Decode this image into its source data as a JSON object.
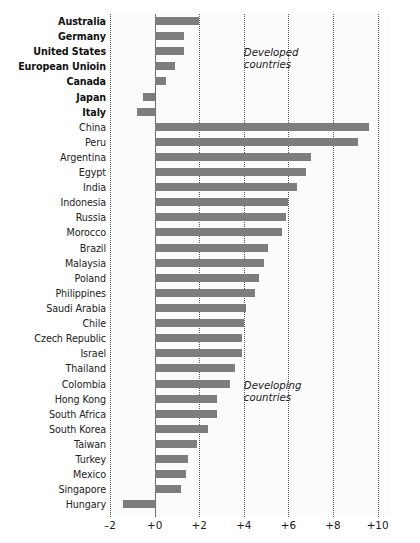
{
  "chart_data": {
    "type": "bar",
    "orientation": "horizontal",
    "title": "",
    "subtitle": "",
    "xlabel": "",
    "ylabel": "",
    "xlim": [
      -2,
      10.6
    ],
    "grid": true,
    "gridlines": [
      -2,
      0,
      2,
      4,
      6,
      8,
      10
    ],
    "tick_labels": [
      "–2",
      "+0",
      "+2",
      "+4",
      "+6",
      "+8",
      "+10"
    ],
    "tick_values": [
      -2,
      0,
      2,
      4,
      6,
      8,
      10
    ],
    "bar_color": "#7d7d7d",
    "legend": null,
    "annotations": [
      {
        "text": "Developed\ncountries",
        "x": 4.0,
        "y_row": 2
      },
      {
        "text": "Developing\ncountries",
        "x": 4.0,
        "y_row": 24
      }
    ],
    "groups": [
      {
        "name": "Developed countries",
        "style": "bold",
        "categories": [
          "Australia",
          "Germany",
          "United States",
          "European Unioin",
          "Canada",
          "Japan",
          "Italy"
        ],
        "values": [
          2.0,
          1.3,
          1.3,
          0.9,
          0.5,
          -0.5,
          -0.8
        ]
      },
      {
        "name": "Developing countries",
        "style": "regular",
        "categories": [
          "China",
          "Peru",
          "Argentina",
          "Egypt",
          "India",
          "Indonesia",
          "Russia",
          "Morocco",
          "Brazil",
          "Malaysia",
          "Poland",
          "Philippines",
          "Saudi Arabia",
          "Chile",
          "Czech Republic",
          "Israel",
          "Thailand",
          "Colombia",
          "Hong Kong",
          "South Africa",
          "South Korea",
          "Taiwan",
          "Turkey",
          "Mexico",
          "Singapore",
          "Hungary"
        ],
        "values": [
          9.6,
          9.1,
          7.0,
          6.8,
          6.4,
          6.0,
          5.9,
          5.7,
          5.1,
          4.9,
          4.7,
          4.5,
          4.1,
          4.0,
          3.9,
          3.9,
          3.6,
          3.4,
          2.8,
          2.8,
          2.4,
          1.9,
          1.5,
          1.4,
          1.2,
          -1.4
        ]
      }
    ],
    "categories": [
      "Australia",
      "Germany",
      "United States",
      "European Unioin",
      "Canada",
      "Japan",
      "Italy",
      "China",
      "Peru",
      "Argentina",
      "Egypt",
      "India",
      "Indonesia",
      "Russia",
      "Morocco",
      "Brazil",
      "Malaysia",
      "Poland",
      "Philippines",
      "Saudi Arabia",
      "Chile",
      "Czech Republic",
      "Israel",
      "Thailand",
      "Colombia",
      "Hong Kong",
      "South Africa",
      "South Korea",
      "Taiwan",
      "Turkey",
      "Mexico",
      "Singapore",
      "Hungary"
    ],
    "values": [
      2.0,
      1.3,
      1.3,
      0.9,
      0.5,
      -0.5,
      -0.8,
      9.6,
      9.1,
      7.0,
      6.8,
      6.4,
      6.0,
      5.9,
      5.7,
      5.1,
      4.9,
      4.7,
      4.5,
      4.1,
      4.0,
      3.9,
      3.9,
      3.6,
      3.4,
      2.8,
      2.8,
      2.4,
      1.9,
      1.5,
      1.4,
      1.2,
      -1.4
    ]
  }
}
